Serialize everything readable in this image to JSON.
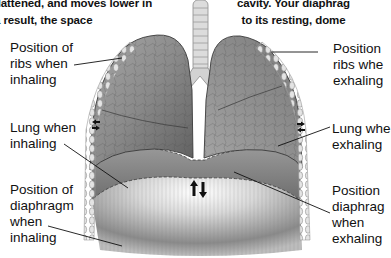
{
  "caption": {
    "left_lines": [
      "flattened, and moves lower in",
      "a result, the space"
    ],
    "right_lines": [
      "cavity. Your diaphrag",
      "to its resting, dome"
    ]
  },
  "labels": {
    "left": [
      {
        "id": "ribs-inhaling",
        "lines": [
          "Position of",
          "ribs when",
          "inhaling"
        ]
      },
      {
        "id": "lung-inhaling",
        "lines": [
          "Lung when",
          "inhaling"
        ]
      },
      {
        "id": "diaphragm-inhaling",
        "lines": [
          "Position of",
          "diaphragm",
          "when",
          "inhaling"
        ]
      }
    ],
    "right": [
      {
        "id": "ribs-exhaling",
        "lines": [
          "Position",
          "ribs whe",
          "exhaling"
        ]
      },
      {
        "id": "lung-exhaling",
        "lines": [
          "Lung whe",
          "exhaling"
        ]
      },
      {
        "id": "diaphragm-exhaling",
        "lines": [
          "Position",
          "diaphrag",
          "when",
          "exhaling"
        ]
      }
    ]
  },
  "colors": {
    "lung_fill": "#8a8a8a",
    "lung_dark": "#5e5e5e",
    "rib_fill": "#d6d6d6",
    "diaphragm_light": "#f2f2f2",
    "diaphragm_dark": "#7a7a7a",
    "text": "#111111"
  },
  "icons": {
    "center_arrows": "up-down-arrows-icon",
    "side_arrows": "inward-arrows-icon"
  }
}
